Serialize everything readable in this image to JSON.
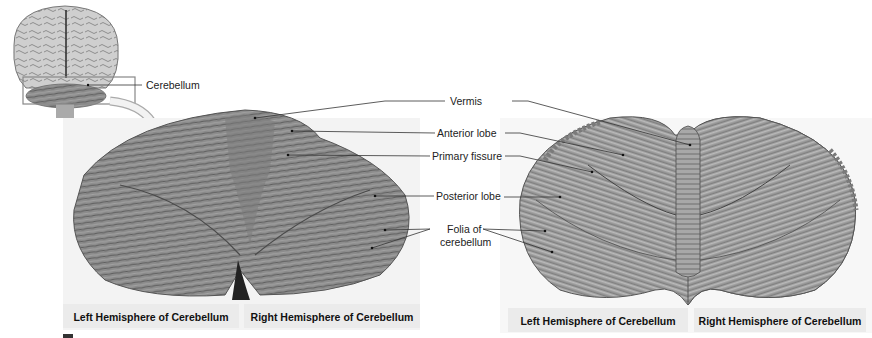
{
  "figure": {
    "inset": {
      "label": "Cerebellum",
      "icon": "brain-posterior-view-icon"
    },
    "labels": {
      "vermis": "Vermis",
      "anterior_lobe": "Anterior lobe",
      "primary_fissure": "Primary fissure",
      "posterior_lobe": "Posterior lobe",
      "folia_line1": "Folia of",
      "folia_line2": "cerebellum"
    },
    "photo_panel": {
      "left_caption": "Left Hemisphere of Cerebellum",
      "right_caption": "Right Hemisphere of Cerebellum"
    },
    "illustration_panel": {
      "left_caption": "Left Hemisphere of Cerebellum",
      "right_caption": "Right Hemisphere of Cerebellum"
    },
    "colors": {
      "photo_tissue": "#8a8a8a",
      "illustration_tissue": "#9a9a9a",
      "caption_bg": "#ebebeb",
      "leader_line": "#333333"
    }
  }
}
